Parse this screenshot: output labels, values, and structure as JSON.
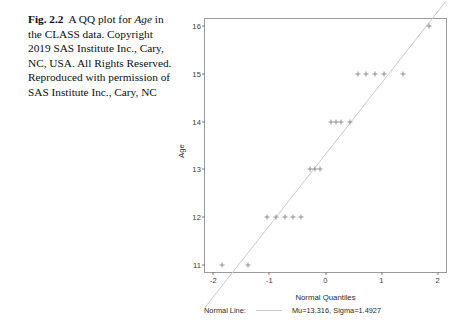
{
  "caption": {
    "figure_label": "Fig. 2.2",
    "text_part1": "A QQ plot for ",
    "emphasis": "Age",
    "text_part2": " in the CLASS data. Copyright 2019 SAS Institute Inc., Cary, NC, USA. All Rights Reserved. Reproduced with permission of SAS Institute Inc., Cary, NC"
  },
  "legend": {
    "series_label": "Normal Line:",
    "params_label": "Mu=13.316, Sigma=1.4927",
    "line_color": "#c9c9c9"
  },
  "chart_data": {
    "type": "scatter",
    "title": "",
    "xlabel": "Normal Quantiles",
    "ylabel": "Age",
    "xlim": [
      -2.15,
      2.15
    ],
    "ylim": [
      10.85,
      16.15
    ],
    "xticks": [
      -2,
      -1,
      0,
      1,
      2
    ],
    "xtick_labels": [
      "-2",
      "-1",
      "0",
      "1",
      "2"
    ],
    "yticks": [
      11,
      12,
      13,
      14,
      15,
      16
    ],
    "ytick_labels": [
      "11",
      "12",
      "13",
      "14",
      "15",
      "16"
    ],
    "grid": false,
    "legend_position": "below-axes",
    "marker": "plus",
    "marker_color": "#8f8f8f",
    "frame_color": "#9a9a9a",
    "series": [
      {
        "name": "Age quantiles",
        "x": [
          -1.85,
          -1.38,
          -1.05,
          -0.88,
          -0.72,
          -0.58,
          -0.44,
          -0.27,
          -0.18,
          -0.09,
          0.09,
          0.18,
          0.27,
          0.44,
          0.58,
          0.72,
          0.88,
          1.05,
          1.38,
          1.85
        ],
        "y": [
          11,
          11,
          12,
          12,
          12,
          12,
          12,
          13,
          13,
          13,
          14,
          14,
          14,
          14,
          15,
          15,
          15,
          15,
          15,
          16
        ]
      }
    ],
    "reference_line": {
      "name": "Normal Line",
      "mu": 13.316,
      "sigma": 1.4927,
      "color": "#c9c9c9",
      "x": [
        -2.15,
        2.15
      ],
      "y": [
        10.107,
        16.525
      ]
    }
  }
}
